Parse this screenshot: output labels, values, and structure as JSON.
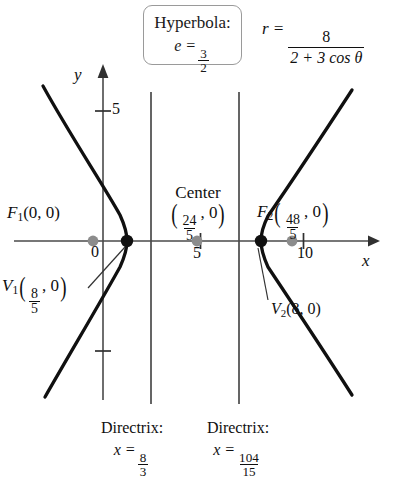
{
  "figure": {
    "type": "conic-section-diagram",
    "conic": "Hyperbola",
    "callout": {
      "title": "Hyperbola:",
      "eccentricity_label": "e =",
      "eccentricity_num": "3",
      "eccentricity_den": "2",
      "eccentricity_value": 1.5
    },
    "equation": {
      "lhs": "r =",
      "numerator": "8",
      "denominator": "2 + 3 cos θ",
      "full": "r = 8 / (2 + 3 cos θ)"
    },
    "axes": {
      "x_label": "x",
      "y_label": "y",
      "x_ticks": [
        {
          "label": "0",
          "value": 0
        },
        {
          "label": "5",
          "value": 5
        },
        {
          "label": "10",
          "value": 10
        }
      ],
      "y_ticks": [
        {
          "label": "5",
          "value": 5
        },
        {
          "label": "",
          "value": -5
        }
      ]
    },
    "points": {
      "focus1": {
        "name": "F",
        "sub": "1",
        "coords": "(0, 0)",
        "x": 0,
        "y": 0,
        "marker": "gray"
      },
      "focus2": {
        "name": "F",
        "sub": "2",
        "coords_num": "48",
        "coords_den": "5",
        "coords_tail": ", 0",
        "x": 9.6,
        "y": 0,
        "marker": "gray"
      },
      "vertex1": {
        "name": "V",
        "sub": "1",
        "coords_num": "8",
        "coords_den": "5",
        "coords_tail": ", 0",
        "x": 1.6,
        "y": 0,
        "marker": "black"
      },
      "vertex2": {
        "name": "V",
        "sub": "2",
        "coords": "(8, 0)",
        "x": 8,
        "y": 0,
        "marker": "black"
      },
      "center": {
        "label": "Center",
        "coords_num": "24",
        "coords_den": "5",
        "coords_tail": ", 0",
        "x": 4.8,
        "y": 0,
        "marker": "gray"
      }
    },
    "directrices": [
      {
        "label": "Directrix:",
        "eq_lhs": "x =",
        "num": "8",
        "den": "3",
        "value": 2.6667
      },
      {
        "label": "Directrix:",
        "eq_lhs": "x =",
        "num": "104",
        "den": "15",
        "value": 6.9333
      }
    ],
    "colors": {
      "curve": "#101010",
      "axis": "#4a4a4a",
      "directrix": "#4a4a4a",
      "focus_marker": "#8c8c8c",
      "vertex_marker": "#101010",
      "callout_border": "#9a9a9a",
      "background": "#ffffff"
    }
  }
}
